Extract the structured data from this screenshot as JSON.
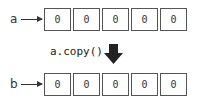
{
  "source": {
    "label": "a",
    "values": [
      "0",
      "0",
      "0",
      "0",
      "0"
    ]
  },
  "operation": {
    "label": "a.copy()",
    "arrow_icon": "down-arrow-icon"
  },
  "target": {
    "label": "b",
    "values": [
      "0",
      "0",
      "0",
      "0",
      "0"
    ]
  },
  "colors": {
    "border": "#555555",
    "text": "#333333",
    "arrow": "#222222"
  }
}
